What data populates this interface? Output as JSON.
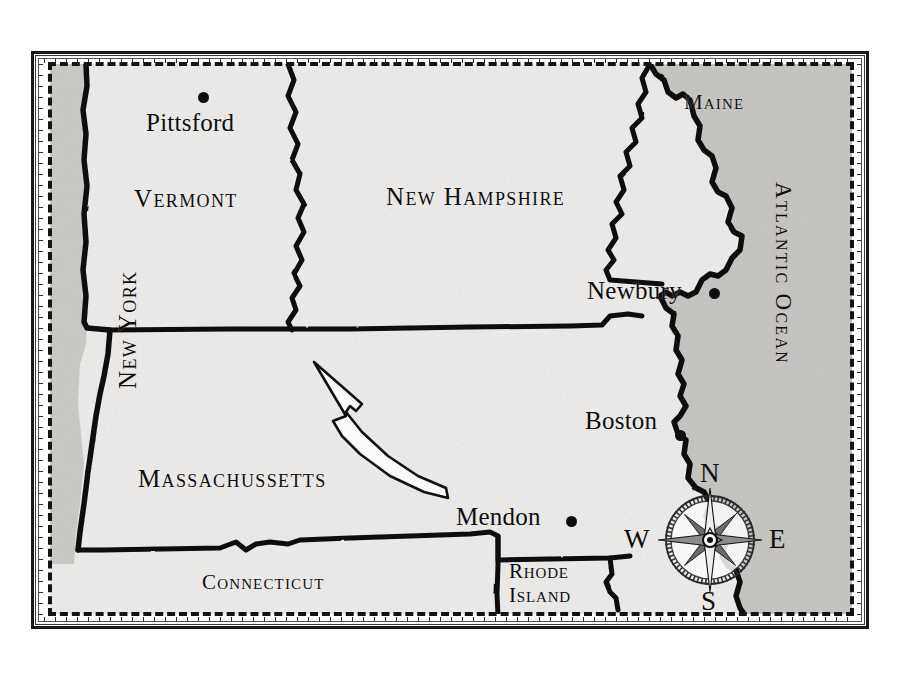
{
  "map": {
    "title": "Historical map of New England",
    "style": "antique engraved sepia-gray map with dashed neatline and graduated border",
    "background_color": "#f2f1ef",
    "ocean_color": "#c9c7c4",
    "ink_color": "#0d0d0d",
    "states": [
      {
        "id": "new-york",
        "label": "New York",
        "orientation": "rotated-vertical"
      },
      {
        "id": "vermont",
        "label": "Vermont",
        "orientation": "horizontal"
      },
      {
        "id": "new-hampshire",
        "label": "New Hampshire",
        "orientation": "horizontal"
      },
      {
        "id": "maine",
        "label": "Maine",
        "orientation": "horizontal"
      },
      {
        "id": "massachussetts",
        "label": "Massachussetts",
        "orientation": "horizontal"
      },
      {
        "id": "connecticut",
        "label": "Connecticut",
        "orientation": "horizontal"
      },
      {
        "id": "rhode-island",
        "label_line1": "Rhode",
        "label_line2": "Island",
        "orientation": "horizontal"
      }
    ],
    "water": [
      {
        "id": "atlantic-ocean",
        "label": "Atlantic Ocean",
        "orientation": "rotated-vertical"
      }
    ],
    "cities": [
      {
        "id": "pittsford",
        "label": "Pittsford",
        "marker": "dot"
      },
      {
        "id": "newbury",
        "label": "Newbury",
        "marker": "dot"
      },
      {
        "id": "boston",
        "label": "Boston",
        "marker": "dot"
      },
      {
        "id": "mendon",
        "label": "Mendon",
        "marker": "dot"
      }
    ],
    "compass": {
      "north": "N",
      "east": "E",
      "south": "S",
      "west": "W",
      "points": 8,
      "style": "engraved compass rose with toothed outer ring"
    },
    "annotation": {
      "id": "pointer-arrow",
      "description": "hollow outlined arrow pointing north-west from Mendon toward central Massachussetts"
    }
  }
}
